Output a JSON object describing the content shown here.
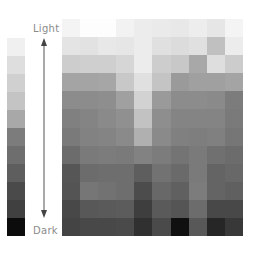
{
  "chart_data": {
    "type": "heatmap",
    "title": "",
    "legend": {
      "type": "grayscale-scale",
      "top_label": "Light",
      "bottom_label": "Dark",
      "swatches": [
        "#f0f0f0",
        "#dedede",
        "#d0d0d0",
        "#c4c4c4",
        "#a8a8a8",
        "#7c7c7c",
        "#6e6e6e",
        "#5e5e5e",
        "#4a4a4a",
        "#404040",
        "#0c0c0c"
      ]
    },
    "rows": 12,
    "cols": 10,
    "cells": [
      [
        "#f4f4f4",
        "#fdfdfd",
        "#fdfdfd",
        "#f2f2f2",
        "#ececec",
        "#eaeaea",
        "#e8e8e8",
        "#ededed",
        "#e6e6e6",
        "#f4f4f4"
      ],
      [
        "#e4e4e4",
        "#e2e2e2",
        "#e8e8e8",
        "#e6e6e6",
        "#ececec",
        "#e0e0e0",
        "#dcdcdc",
        "#e0e0e0",
        "#c0c0c0",
        "#ececec"
      ],
      [
        "#cdcdcd",
        "#cfcfcf",
        "#cfcfcf",
        "#d6d6d6",
        "#ececec",
        "#cdcdcd",
        "#c8c8c8",
        "#a8a8a8",
        "#dedede",
        "#cccccc"
      ],
      [
        "#a4a4a4",
        "#a4a4a4",
        "#a6a6a6",
        "#c8c8c8",
        "#e0e0e0",
        "#c4c4c4",
        "#9a9a9a",
        "#a0a0a0",
        "#a0a0a0",
        "#a4a4a4"
      ],
      [
        "#8c8c8c",
        "#8c8c8c",
        "#8e8e8e",
        "#a0a0a0",
        "#d2d2d2",
        "#9a9a9a",
        "#8c8c8c",
        "#8c8c8c",
        "#8a8a8a",
        "#7c7c7c"
      ],
      [
        "#808080",
        "#848484",
        "#8a8a8a",
        "#909090",
        "#c2c2c2",
        "#8e8e8e",
        "#848484",
        "#848484",
        "#848484",
        "#7a7a7a"
      ],
      [
        "#7a7a7a",
        "#828282",
        "#848484",
        "#8a8a8a",
        "#b0b0b0",
        "#8a8a8a",
        "#808080",
        "#7e7e7e",
        "#808080",
        "#767676"
      ],
      [
        "#6c6c6c",
        "#7a7a7a",
        "#7c7c7c",
        "#7a7a7a",
        "#828282",
        "#7c7c7c",
        "#747474",
        "#7a7a7a",
        "#707070",
        "#6c6c6c"
      ],
      [
        "#565656",
        "#6c6c6c",
        "#6e6e6e",
        "#6e6e6e",
        "#5e5e5e",
        "#727272",
        "#6a6a6a",
        "#7a7a7a",
        "#646464",
        "#686868"
      ],
      [
        "#545454",
        "#767676",
        "#727272",
        "#6e6e6e",
        "#4c4c4c",
        "#686868",
        "#606060",
        "#7c7c7c",
        "#646464",
        "#606060"
      ],
      [
        "#484848",
        "#585858",
        "#5a5a5a",
        "#5c5c5c",
        "#3e3e3e",
        "#5a5a5a",
        "#555555",
        "#6c6c6c",
        "#484848",
        "#484848"
      ],
      [
        "#444444",
        "#484848",
        "#484848",
        "#4a4a4a",
        "#303030",
        "#4a4a4a",
        "#101010",
        "#585858",
        "#262626",
        "#383838"
      ]
    ],
    "xlabel": "",
    "ylabel": "",
    "grid": false
  },
  "labels": {
    "light": "Light",
    "dark": "Dark"
  }
}
